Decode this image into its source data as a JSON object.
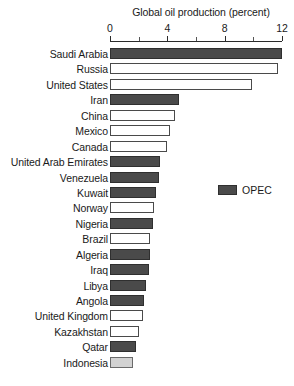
{
  "chart_data": {
    "type": "bar",
    "orientation": "horizontal",
    "title": "Global oil production (percent)",
    "xlabel": "",
    "ylabel": "",
    "xlim": [
      0,
      12
    ],
    "xticks": [
      0,
      4,
      8,
      12
    ],
    "xtick_labels": [
      "0",
      "4",
      "8",
      "12"
    ],
    "minor_tick_step": 2,
    "grid": false,
    "legend": {
      "position": "middle-right",
      "entries": [
        {
          "label": "OPEC",
          "color": "#4a4a4a"
        }
      ]
    },
    "colors": {
      "opec": "#4a4a4a",
      "non_opec": "#ffffff",
      "partial": "#d2d2d2",
      "outline": "#3a3a3a"
    },
    "categories": [
      "Saudi Arabia",
      "Russia",
      "United States",
      "Iran",
      "China",
      "Mexico",
      "Canada",
      "United Arab Emirates",
      "Venezuela",
      "Kuwait",
      "Norway",
      "Nigeria",
      "Brazil",
      "Algeria",
      "Iraq",
      "Libya",
      "Angola",
      "United Kingdom",
      "Kazakhstan",
      "Qatar",
      "Indonesia"
    ],
    "values": [
      12.0,
      11.7,
      9.9,
      4.8,
      4.5,
      4.2,
      4.0,
      3.5,
      3.4,
      3.2,
      3.1,
      3.0,
      2.8,
      2.8,
      2.7,
      2.5,
      2.4,
      2.3,
      2.0,
      1.8,
      1.6
    ],
    "bars": [
      {
        "label": "Saudi Arabia",
        "value": 12.0,
        "group": "opec"
      },
      {
        "label": "Russia",
        "value": 11.7,
        "group": "non_opec"
      },
      {
        "label": "United States",
        "value": 9.9,
        "group": "non_opec"
      },
      {
        "label": "Iran",
        "value": 4.8,
        "group": "opec"
      },
      {
        "label": "China",
        "value": 4.5,
        "group": "non_opec"
      },
      {
        "label": "Mexico",
        "value": 4.2,
        "group": "non_opec"
      },
      {
        "label": "Canada",
        "value": 4.0,
        "group": "non_opec"
      },
      {
        "label": "United Arab Emirates",
        "value": 3.5,
        "group": "opec"
      },
      {
        "label": "Venezuela",
        "value": 3.4,
        "group": "opec"
      },
      {
        "label": "Kuwait",
        "value": 3.2,
        "group": "opec"
      },
      {
        "label": "Norway",
        "value": 3.1,
        "group": "non_opec"
      },
      {
        "label": "Nigeria",
        "value": 3.0,
        "group": "opec"
      },
      {
        "label": "Brazil",
        "value": 2.8,
        "group": "non_opec"
      },
      {
        "label": "Algeria",
        "value": 2.8,
        "group": "opec"
      },
      {
        "label": "Iraq",
        "value": 2.7,
        "group": "opec"
      },
      {
        "label": "Libya",
        "value": 2.5,
        "group": "opec"
      },
      {
        "label": "Angola",
        "value": 2.4,
        "group": "opec"
      },
      {
        "label": "United Kingdom",
        "value": 2.3,
        "group": "non_opec"
      },
      {
        "label": "Kazakhstan",
        "value": 2.0,
        "group": "non_opec"
      },
      {
        "label": "Qatar",
        "value": 1.8,
        "group": "opec"
      },
      {
        "label": "Indonesia",
        "value": 1.6,
        "group": "partial"
      }
    ]
  }
}
